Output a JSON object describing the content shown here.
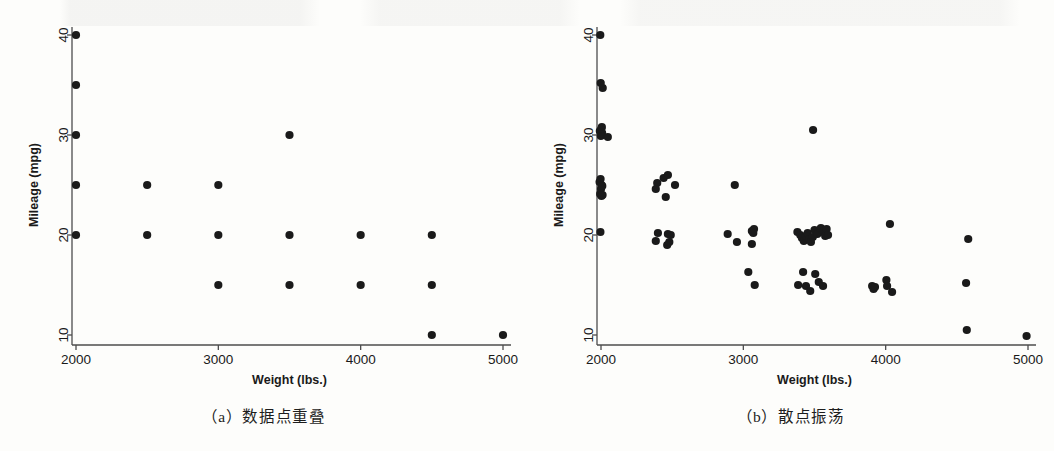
{
  "figure": {
    "background_color": "#fdfdfb",
    "marker_color": "#1a1a1a",
    "axis_color": "#4d4d4d"
  },
  "panels": [
    {
      "id": "a",
      "caption": "（a）数据点重叠",
      "caption_label": "a",
      "caption_text": "数据点重叠"
    },
    {
      "id": "b",
      "caption": "（b）散点振荡",
      "caption_label": "b",
      "caption_text": "散点振荡"
    }
  ],
  "chart_data": [
    {
      "type": "scatter",
      "panel": "a",
      "title": "",
      "caption": "（a）数据点重叠",
      "xlabel": "Weight (lbs.)",
      "ylabel": "Mileage (mpg)",
      "xlim": [
        1900,
        5100
      ],
      "ylim": [
        8.5,
        41
      ],
      "xticks": [
        2000,
        3000,
        4000,
        5000
      ],
      "xticklabels": [
        "2000",
        "3000",
        "4000",
        "5000"
      ],
      "yticks": [
        10,
        20,
        30,
        40
      ],
      "yticklabels": [
        "10",
        "20",
        "30",
        "40"
      ],
      "grid": false,
      "legend": false,
      "marker": "filled-circle",
      "marker_size": 6,
      "note": "Rounded/binned values cause many observations to overplot at identical coordinates",
      "points": [
        {
          "x": 2000,
          "y": 40
        },
        {
          "x": 2000,
          "y": 35
        },
        {
          "x": 2000,
          "y": 30
        },
        {
          "x": 2000,
          "y": 25
        },
        {
          "x": 2000,
          "y": 20
        },
        {
          "x": 2500,
          "y": 25
        },
        {
          "x": 2500,
          "y": 20
        },
        {
          "x": 3000,
          "y": 25
        },
        {
          "x": 3000,
          "y": 20
        },
        {
          "x": 3000,
          "y": 15
        },
        {
          "x": 3500,
          "y": 30
        },
        {
          "x": 3500,
          "y": 20
        },
        {
          "x": 3500,
          "y": 15
        },
        {
          "x": 4000,
          "y": 20
        },
        {
          "x": 4000,
          "y": 15
        },
        {
          "x": 4500,
          "y": 20
        },
        {
          "x": 4500,
          "y": 15
        },
        {
          "x": 4500,
          "y": 10
        },
        {
          "x": 5000,
          "y": 10
        }
      ]
    },
    {
      "type": "scatter",
      "panel": "b",
      "title": "",
      "caption": "（b）散点振荡",
      "xlabel": "Weight (lbs.)",
      "ylabel": "Mileage (mpg)",
      "xlim": [
        1900,
        5100
      ],
      "ylim": [
        8.5,
        41
      ],
      "xticks": [
        2000,
        3000,
        4000,
        5000
      ],
      "xticklabels": [
        "2000",
        "3000",
        "4000",
        "5000"
      ],
      "yticks": [
        10,
        20,
        30,
        40
      ],
      "yticklabels": [
        "10",
        "20",
        "30",
        "40"
      ],
      "grid": false,
      "legend": false,
      "marker": "filled-circle",
      "marker_size": 6,
      "note": "Same data as panel (a) with random jitter applied so overlapping observations become visible",
      "points": [
        {
          "x": 1995,
          "y": 40.0
        },
        {
          "x": 1998,
          "y": 35.2
        },
        {
          "x": 2012,
          "y": 34.7
        },
        {
          "x": 1992,
          "y": 30.4
        },
        {
          "x": 2002,
          "y": 30.6
        },
        {
          "x": 2008,
          "y": 30.2
        },
        {
          "x": 1999,
          "y": 29.9
        },
        {
          "x": 2006,
          "y": 30.8
        },
        {
          "x": 2048,
          "y": 29.8
        },
        {
          "x": 1990,
          "y": 25.3
        },
        {
          "x": 1997,
          "y": 25.6
        },
        {
          "x": 2004,
          "y": 25.0
        },
        {
          "x": 2000,
          "y": 24.6
        },
        {
          "x": 2009,
          "y": 24.9
        },
        {
          "x": 1994,
          "y": 24.1
        },
        {
          "x": 2003,
          "y": 23.9
        },
        {
          "x": 2011,
          "y": 24.0
        },
        {
          "x": 1996,
          "y": 20.3
        },
        {
          "x": 2395,
          "y": 25.2
        },
        {
          "x": 2440,
          "y": 25.7
        },
        {
          "x": 2470,
          "y": 26.0
        },
        {
          "x": 2385,
          "y": 24.6
        },
        {
          "x": 2520,
          "y": 25.0
        },
        {
          "x": 2455,
          "y": 23.8
        },
        {
          "x": 2400,
          "y": 20.2
        },
        {
          "x": 2470,
          "y": 20.1
        },
        {
          "x": 2490,
          "y": 20.0
        },
        {
          "x": 2385,
          "y": 19.4
        },
        {
          "x": 2465,
          "y": 19.0
        },
        {
          "x": 2480,
          "y": 19.3
        },
        {
          "x": 2940,
          "y": 25.0
        },
        {
          "x": 2890,
          "y": 20.1
        },
        {
          "x": 3060,
          "y": 20.4
        },
        {
          "x": 3075,
          "y": 20.6
        },
        {
          "x": 3070,
          "y": 20.2
        },
        {
          "x": 2955,
          "y": 19.3
        },
        {
          "x": 3060,
          "y": 19.1
        },
        {
          "x": 3035,
          "y": 16.3
        },
        {
          "x": 3080,
          "y": 15.0
        },
        {
          "x": 3490,
          "y": 30.5
        },
        {
          "x": 3380,
          "y": 20.3
        },
        {
          "x": 3400,
          "y": 20.0
        },
        {
          "x": 3412,
          "y": 19.7
        },
        {
          "x": 3425,
          "y": 19.4
        },
        {
          "x": 3440,
          "y": 19.9
        },
        {
          "x": 3452,
          "y": 20.2
        },
        {
          "x": 3462,
          "y": 19.6
        },
        {
          "x": 3475,
          "y": 19.3
        },
        {
          "x": 3488,
          "y": 19.8
        },
        {
          "x": 3500,
          "y": 20.5
        },
        {
          "x": 3520,
          "y": 20.1
        },
        {
          "x": 3545,
          "y": 20.7
        },
        {
          "x": 3560,
          "y": 20.3
        },
        {
          "x": 3575,
          "y": 19.9
        },
        {
          "x": 3585,
          "y": 20.6
        },
        {
          "x": 3595,
          "y": 20.0
        },
        {
          "x": 3420,
          "y": 16.3
        },
        {
          "x": 3505,
          "y": 16.1
        },
        {
          "x": 3385,
          "y": 15.0
        },
        {
          "x": 3440,
          "y": 14.9
        },
        {
          "x": 3530,
          "y": 15.3
        },
        {
          "x": 3470,
          "y": 14.4
        },
        {
          "x": 3560,
          "y": 14.9
        },
        {
          "x": 3905,
          "y": 14.9
        },
        {
          "x": 3915,
          "y": 14.6
        },
        {
          "x": 3925,
          "y": 14.8
        },
        {
          "x": 4030,
          "y": 21.1
        },
        {
          "x": 4005,
          "y": 15.5
        },
        {
          "x": 4010,
          "y": 14.9
        },
        {
          "x": 4045,
          "y": 14.3
        },
        {
          "x": 4580,
          "y": 19.6
        },
        {
          "x": 4565,
          "y": 15.2
        },
        {
          "x": 4570,
          "y": 10.5
        },
        {
          "x": 4990,
          "y": 9.9
        }
      ]
    }
  ]
}
